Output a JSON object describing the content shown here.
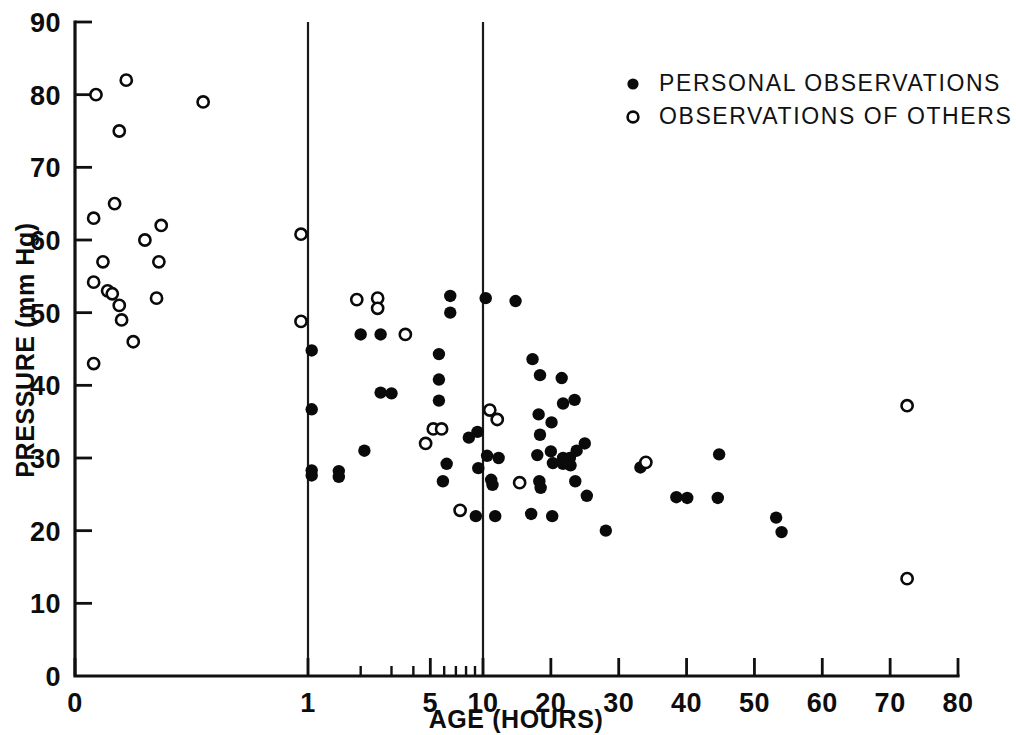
{
  "chart_data": {
    "type": "scatter",
    "title": "",
    "xlabel": "AGE (HOURS)",
    "ylabel": "PRESSURE (mm Hg)",
    "xlim": [
      0,
      80
    ],
    "ylim": [
      0,
      90
    ],
    "grid": false,
    "x_scale": "piecewise: compressed 0-1, log-like 1-10, linear 10-80",
    "x_ticks": [
      "0",
      "1",
      "5",
      "10",
      "20",
      "30",
      "40",
      "50",
      "60",
      "70",
      "80"
    ],
    "x_tick_values": [
      0,
      1,
      5,
      10,
      20,
      30,
      40,
      50,
      60,
      70,
      80
    ],
    "x_minor_ticks": [
      2,
      3,
      4,
      6,
      7,
      8,
      9
    ],
    "y_ticks": [
      "0",
      "10",
      "20",
      "30",
      "40",
      "50",
      "60",
      "70",
      "80",
      "90"
    ],
    "y_tick_values": [
      0,
      10,
      20,
      30,
      40,
      50,
      60,
      70,
      80,
      90
    ],
    "legend_position": "top-right",
    "annotations": [
      {
        "kind": "vertical-divider",
        "x": 1
      },
      {
        "kind": "vertical-divider",
        "x": 10
      }
    ],
    "series": [
      {
        "name": "PERSONAL OBSERVATIONS",
        "marker": "filled-circle",
        "color": "#0a0a0a",
        "points": [
          [
            1.05,
            44.8
          ],
          [
            1.05,
            36.7
          ],
          [
            1.05,
            28.3
          ],
          [
            1.05,
            27.6
          ],
          [
            1.5,
            28.2
          ],
          [
            1.5,
            27.4
          ],
          [
            2.0,
            47.0
          ],
          [
            2.1,
            31.0
          ],
          [
            2.6,
            47.0
          ],
          [
            2.6,
            39.0
          ],
          [
            3.0,
            38.9
          ],
          [
            5.6,
            44.3
          ],
          [
            5.6,
            40.8
          ],
          [
            5.6,
            37.9
          ],
          [
            6.5,
            52.3
          ],
          [
            6.5,
            50.0
          ],
          [
            6.2,
            29.2
          ],
          [
            5.9,
            26.8
          ],
          [
            8.3,
            32.8
          ],
          [
            9.3,
            33.6
          ],
          [
            9.4,
            28.6
          ],
          [
            9.1,
            22.0
          ],
          [
            10.4,
            52.0
          ],
          [
            10.6,
            30.3
          ],
          [
            11.2,
            27.0
          ],
          [
            11.4,
            26.3
          ],
          [
            11.8,
            22.0
          ],
          [
            12.3,
            30.0
          ],
          [
            14.8,
            51.6
          ],
          [
            17.3,
            43.6
          ],
          [
            18.4,
            41.4
          ],
          [
            18.2,
            36.0
          ],
          [
            18.4,
            33.2
          ],
          [
            18.0,
            30.4
          ],
          [
            18.3,
            26.8
          ],
          [
            18.5,
            25.9
          ],
          [
            17.1,
            22.3
          ],
          [
            20.1,
            34.9
          ],
          [
            20.0,
            30.9
          ],
          [
            20.3,
            29.3
          ],
          [
            20.2,
            22.0
          ],
          [
            21.6,
            41.0
          ],
          [
            21.8,
            37.5
          ],
          [
            21.8,
            30.0
          ],
          [
            21.8,
            29.2
          ],
          [
            22.8,
            30.0
          ],
          [
            22.9,
            29.0
          ],
          [
            23.5,
            38.0
          ],
          [
            23.8,
            31.0
          ],
          [
            23.6,
            26.8
          ],
          [
            25.0,
            32.0
          ],
          [
            25.3,
            24.8
          ],
          [
            28.1,
            20.0
          ],
          [
            33.2,
            28.7
          ],
          [
            38.5,
            24.6
          ],
          [
            40.1,
            24.5
          ],
          [
            44.8,
            30.5
          ],
          [
            44.6,
            24.5
          ],
          [
            53.2,
            21.8
          ],
          [
            54.0,
            19.8
          ]
        ]
      },
      {
        "name": "OBSERVATIONS OF OTHERS",
        "marker": "open-circle",
        "color": "#0a0a0a",
        "points": [
          [
            0.09,
            80.0
          ],
          [
            0.22,
            82.0
          ],
          [
            0.19,
            75.0
          ],
          [
            0.17,
            65.0
          ],
          [
            0.08,
            63.0
          ],
          [
            0.12,
            57.0
          ],
          [
            0.08,
            54.2
          ],
          [
            0.14,
            53.0
          ],
          [
            0.16,
            52.6
          ],
          [
            0.19,
            51.0
          ],
          [
            0.2,
            49.0
          ],
          [
            0.25,
            46.0
          ],
          [
            0.08,
            43.0
          ],
          [
            0.3,
            60.0
          ],
          [
            0.37,
            62.0
          ],
          [
            0.36,
            57.0
          ],
          [
            0.35,
            52.0
          ],
          [
            0.55,
            79.0
          ],
          [
            0.97,
            60.8
          ],
          [
            0.97,
            48.8
          ],
          [
            1.9,
            51.8
          ],
          [
            2.5,
            52.0
          ],
          [
            2.5,
            50.6
          ],
          [
            3.6,
            47.0
          ],
          [
            5.2,
            34.0
          ],
          [
            5.8,
            34.0
          ],
          [
            4.7,
            32.0
          ],
          [
            7.4,
            22.8
          ],
          [
            11.0,
            36.6
          ],
          [
            12.1,
            35.3
          ],
          [
            15.4,
            26.6
          ],
          [
            34.0,
            29.4
          ],
          [
            72.5,
            37.2
          ],
          [
            72.5,
            13.4
          ]
        ]
      }
    ]
  },
  "legend": {
    "entries": [
      {
        "marker": "filled-circle",
        "label": "PERSONAL OBSERVATIONS"
      },
      {
        "marker": "open-circle",
        "label": "OBSERVATIONS OF OTHERS"
      }
    ]
  },
  "axes": {
    "x_title": "AGE (HOURS)",
    "y_title": "PRESSURE (mm Hg)",
    "x_tick_labels": [
      "0",
      "1",
      "5",
      "10",
      "20",
      "30",
      "40",
      "50",
      "60",
      "70",
      "80"
    ],
    "y_tick_labels": [
      "0",
      "10",
      "20",
      "30",
      "40",
      "50",
      "60",
      "70",
      "80",
      "90"
    ]
  }
}
